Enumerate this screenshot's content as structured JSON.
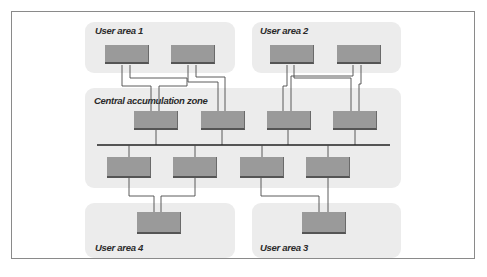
{
  "diagram": {
    "type": "network topology",
    "zones": {
      "user_area_1": {
        "label": "User area 1"
      },
      "user_area_2": {
        "label": "User area 2"
      },
      "central": {
        "label": "Central accumulation zone"
      },
      "user_area_3": {
        "label": "User area 3"
      },
      "user_area_4": {
        "label": "User area 4"
      }
    },
    "nodes": {
      "ua1": [
        "ua1-node-1",
        "ua1-node-2"
      ],
      "ua2": [
        "ua2-node-1",
        "ua2-node-2"
      ],
      "central_top": [
        "cz-top-1",
        "cz-top-2",
        "cz-top-3",
        "cz-top-4"
      ],
      "central_bottom": [
        "cz-bottom-1",
        "cz-bottom-2",
        "cz-bottom-3",
        "cz-bottom-4"
      ],
      "ua4": [
        "ua4-node-1"
      ],
      "ua3": [
        "ua3-node-1"
      ]
    },
    "colors": {
      "zone_fill": "#ececec",
      "node_fill": "#9a9a9a",
      "node_shadow": "#555555",
      "wire": "#4a4a4a",
      "frame": "#8a8a8a"
    }
  }
}
